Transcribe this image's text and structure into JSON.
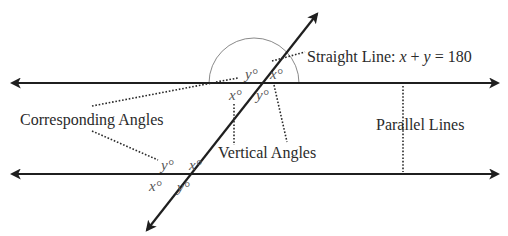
{
  "diagram": {
    "colors": {
      "line": "#1f1f1f",
      "leader": "#2a2a2a",
      "arc": "#8a8a8a",
      "angle_text": "#555555",
      "label_text": "#2a2a2a"
    },
    "labels": {
      "straight_line_prefix": "Straight Line: ",
      "straight_line_eq_x": "x",
      "straight_line_eq_plus": " + ",
      "straight_line_eq_y": "y",
      "straight_line_eq_rest": " = 180",
      "corresponding_angles": "Corresponding Angles",
      "vertical_angles": "Vertical Angles",
      "parallel_lines": "Parallel Lines"
    },
    "top_intersection": {
      "upper_left": "y°",
      "upper_right": "x°",
      "lower_left": "x°",
      "lower_right": "y°"
    },
    "bottom_intersection": {
      "upper_left": "y°",
      "upper_right": "x°",
      "lower_left": "x°",
      "lower_right": "y°"
    }
  }
}
